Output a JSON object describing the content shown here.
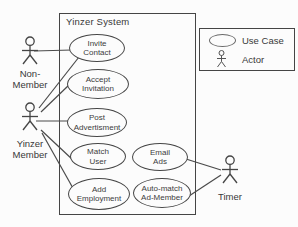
{
  "diagram": {
    "type": "uml-use-case",
    "system_title": "Yinzer System"
  },
  "legend": {
    "use_case_label": "Use Case",
    "actor_label": "Actor"
  },
  "usecases": [
    {
      "id": "invite-contact",
      "line1": "Invite",
      "line2": "Contact"
    },
    {
      "id": "accept-invitation",
      "line1": "Accept",
      "line2": "Invitation"
    },
    {
      "id": "post-advertisment",
      "line1": "Post",
      "line2": "Advertisment"
    },
    {
      "id": "match-user",
      "line1": "Match",
      "line2": "User"
    },
    {
      "id": "add-employment",
      "line1": "Add",
      "line2": "Employment"
    },
    {
      "id": "email-ads",
      "line1": "Email",
      "line2": "Ads"
    },
    {
      "id": "auto-match-ad-member",
      "line1": "Auto-match",
      "line2": "Ad-Member"
    }
  ],
  "actors": [
    {
      "id": "non-member",
      "line1": "Non-",
      "line2": "Member"
    },
    {
      "id": "yinzer-member",
      "line1": "Yinzer",
      "line2": "Member"
    },
    {
      "id": "timer",
      "line1": "Timer",
      "line2": ""
    }
  ],
  "associations": [
    {
      "from": "non-member",
      "to": "invite-contact"
    },
    {
      "from": "yinzer-member",
      "to": "invite-contact"
    },
    {
      "from": "yinzer-member",
      "to": "accept-invitation"
    },
    {
      "from": "yinzer-member",
      "to": "post-advertisment"
    },
    {
      "from": "yinzer-member",
      "to": "match-user"
    },
    {
      "from": "yinzer-member",
      "to": "add-employment"
    },
    {
      "from": "email-ads",
      "to": "timer"
    },
    {
      "from": "auto-match-ad-member",
      "to": "timer"
    }
  ],
  "colors": {
    "stroke": "#454545",
    "text": "#3c3c3c",
    "background": "#fcfcfc"
  }
}
